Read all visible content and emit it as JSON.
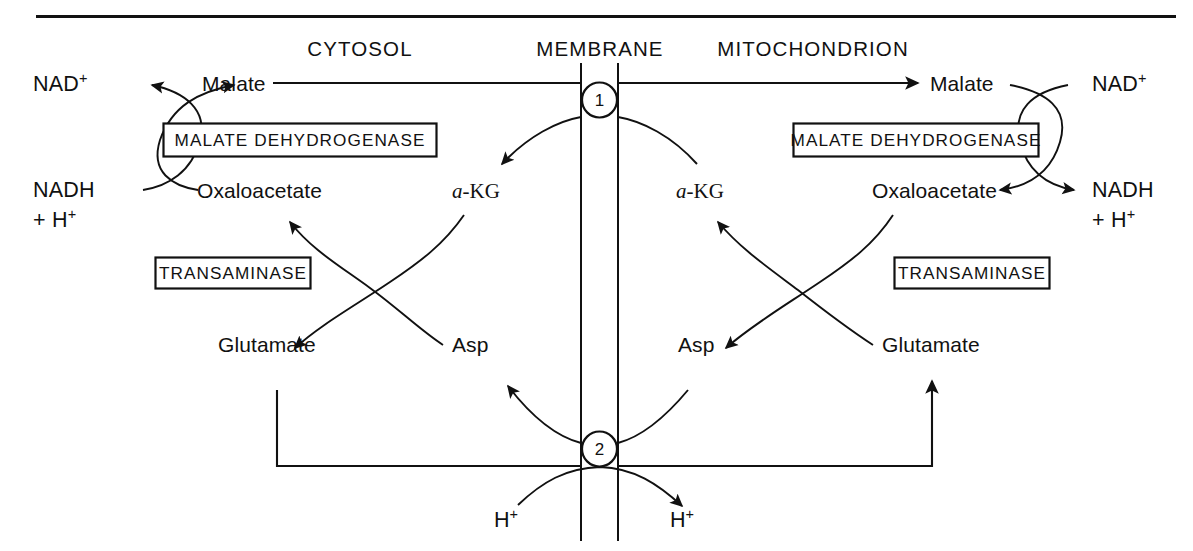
{
  "figure": {
    "compartments": {
      "left": "CYTOSOL",
      "middle": "MEMBRANE",
      "right": "MITOCHONDRION"
    }
  },
  "enzymes": {
    "malate_dehydrogenase_cytosol": "MALATE DEHYDROGENASE",
    "malate_dehydrogenase_mito": "MALATE DEHYDROGENASE",
    "transaminase_cytosol": "TRANSAMINASE",
    "transaminase_mito": "TRANSAMINASE"
  },
  "cytosol": {
    "nad": "NAD",
    "nad_charge": "+",
    "nadh": "NADH",
    "nadh_proton_line": "+ H",
    "nadh_proton_charge": "+",
    "malate": "Malate",
    "oxaloacetate": "Oxaloacetate",
    "akg_alpha": "a",
    "akg_rest": "-KG",
    "glutamate": "Glutamate",
    "asp": "Asp",
    "hplus": "H",
    "hplus_charge": "+"
  },
  "mitochondrion": {
    "nad": "NAD",
    "nad_charge": "+",
    "nadh": "NADH",
    "nadh_proton_line": "+ H",
    "nadh_proton_charge": "+",
    "malate": "Malate",
    "oxaloacetate": "Oxaloacetate",
    "akg_alpha": "a",
    "akg_rest": "-KG",
    "glutamate": "Glutamate",
    "asp": "Asp",
    "hplus": "H",
    "hplus_charge": "+"
  },
  "transporters": {
    "node_1": "1",
    "node_2": "2"
  },
  "colors": {
    "ink": "#111111",
    "paper": "#ffffff"
  }
}
